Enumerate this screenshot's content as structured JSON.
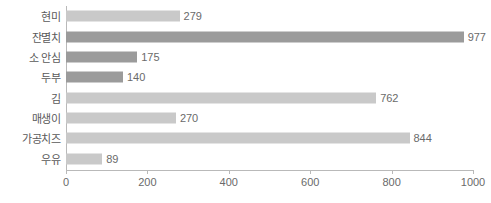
{
  "chart_data": {
    "type": "bar",
    "orientation": "horizontal",
    "title": "",
    "subtitle": "",
    "xlabel": "",
    "ylabel": "",
    "xlim": [
      0,
      1000
    ],
    "grid": false,
    "legend": null,
    "xticks": [
      0,
      200,
      400,
      600,
      800,
      1000
    ],
    "xtick_labels": [
      "0",
      "200",
      "400",
      "600",
      "800",
      "1000"
    ],
    "categories": [
      "현미",
      "잔멸치",
      "소 안심",
      "두부",
      "김",
      "매생이",
      "가공치즈",
      "우유"
    ],
    "values": [
      279,
      977,
      175,
      140,
      762,
      270,
      844,
      89
    ],
    "value_labels": [
      "279",
      "977",
      "175",
      "140",
      "762",
      "270",
      "844",
      "89"
    ],
    "bar_shades": [
      "light",
      "dark",
      "dark",
      "dark",
      "light",
      "light",
      "light",
      "light"
    ],
    "bars": [
      {
        "category": "현미",
        "value": 279,
        "label": "279",
        "shade": "light"
      },
      {
        "category": "잔멸치",
        "value": 977,
        "label": "977",
        "shade": "dark"
      },
      {
        "category": "소 안심",
        "value": 175,
        "label": "175",
        "shade": "dark"
      },
      {
        "category": "두부",
        "value": 140,
        "label": "140",
        "shade": "dark"
      },
      {
        "category": "김",
        "value": 762,
        "label": "762",
        "shade": "light"
      },
      {
        "category": "매생이",
        "value": 270,
        "label": "270",
        "shade": "light"
      },
      {
        "category": "가공치즈",
        "value": 844,
        "label": "844",
        "shade": "light"
      },
      {
        "category": "우유",
        "value": 89,
        "label": "89",
        "shade": "light"
      }
    ]
  },
  "colors": {
    "bar_light": "#c9c9c9",
    "bar_dark": "#9b9b9b",
    "axis": "#b9b9b9",
    "text": "#5a5a5a",
    "tick_text": "#6a6a6a",
    "background": "#ffffff"
  }
}
